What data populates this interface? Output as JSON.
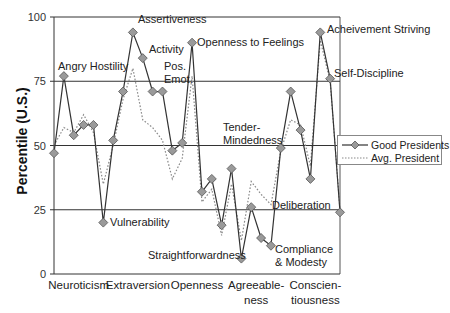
{
  "chart_data": {
    "type": "line",
    "title": "",
    "xlabel": "",
    "ylabel": "Percentile (U.S.)",
    "ylim": [
      0,
      100
    ],
    "yticks": [
      0,
      25,
      50,
      75,
      100
    ],
    "grid": "horizontal at ticks",
    "legend_position": "right, middle",
    "domains": [
      "Neuroticism",
      "Extraversion",
      "Openness",
      "Agreeable-\nness",
      "Conscien-\ntiousness"
    ],
    "facets_per_domain": 6,
    "x": [
      1,
      2,
      3,
      4,
      5,
      6,
      7,
      8,
      9,
      10,
      11,
      12,
      13,
      14,
      15,
      16,
      17,
      18,
      19,
      20,
      21,
      22,
      23,
      24,
      25,
      26,
      27,
      28,
      29,
      30
    ],
    "series": [
      {
        "name": "Good Presidents",
        "style": "solid line with diamond markers",
        "values": [
          47,
          77,
          54,
          58,
          58,
          20,
          52,
          71,
          94,
          84,
          71,
          71,
          48,
          51,
          90,
          32,
          37,
          19,
          41,
          6,
          26,
          14,
          11,
          49,
          71,
          56,
          37,
          94,
          76,
          24
        ]
      },
      {
        "name": "Avg. President",
        "style": "dotted line",
        "values": [
          50,
          57,
          55,
          62,
          55,
          35,
          50,
          68,
          80,
          60,
          57,
          52,
          37,
          45,
          77,
          28,
          33,
          15,
          35,
          13,
          36,
          31,
          27,
          48,
          60,
          58,
          42,
          91,
          75,
          25
        ]
      }
    ],
    "annotations": [
      {
        "text": "Angry Hostility",
        "point": 2
      },
      {
        "text": "Vulnerability",
        "point": 6
      },
      {
        "text": "Assertiveness",
        "point": 9
      },
      {
        "text": "Activity",
        "point": 10
      },
      {
        "text": "Pos.\nEmot.",
        "point": 12
      },
      {
        "text": "Openness to Feelings",
        "point": 15
      },
      {
        "text": "Straightforwardness",
        "point": 20
      },
      {
        "text": "Tender-\nMindedness",
        "point": 24
      },
      {
        "text": "Compliance\n& Modesty",
        "point": 23
      },
      {
        "text": "Acheivement Striving",
        "point": 28
      },
      {
        "text": "Self-Discipline",
        "point": 29
      },
      {
        "text": "Deliberation",
        "point": 30
      }
    ]
  },
  "legend": {
    "good": "Good Presidents",
    "avg": "Avg. President"
  },
  "axis": {
    "ylabel": "Percentile (U.S.)"
  },
  "colors": {
    "good_line": "#333333",
    "marker_fill": "#9a9a9a",
    "avg_line": "#8a8a8a",
    "grid": "#333333"
  }
}
